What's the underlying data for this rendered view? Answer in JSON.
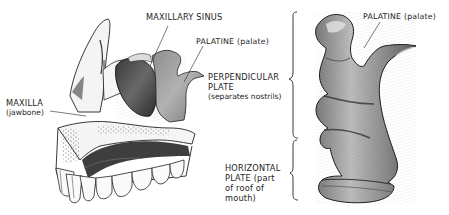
{
  "figure": {
    "left_view": {
      "description": "Side view of upper jaw (maxilla) with palatine bone",
      "labels": {
        "maxillary_sinus": "MAXILLARY SINUS",
        "palatine": "PALATINE (palate)",
        "maxilla": "MAXILLA",
        "maxilla_sub": "(jawbone)"
      }
    },
    "middle_labels": {
      "perpendicular_plate_line1": "PERPENDICULAR",
      "perpendicular_plate_line2": "PLATE",
      "perpendicular_plate_sub": "(separates nostrils)",
      "horizontal_plate_line1": "HORIZONTAL",
      "horizontal_plate_line2": "PLATE (part",
      "horizontal_plate_line3": "of roof of",
      "horizontal_plate_line4": "mouth)"
    },
    "right_view": {
      "description": "Isolated palatine bone",
      "labels": {
        "palatine": "PALATINE (palate)"
      }
    }
  },
  "colors": {
    "ink": "#1e1e1e",
    "bone_light": "#e8e8e8",
    "bone_mid": "#9a9a9a",
    "bone_dark": "#4a4a4a",
    "background": "#ffffff"
  }
}
